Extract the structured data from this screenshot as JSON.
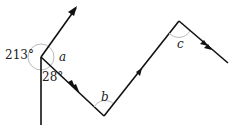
{
  "diagram": {
    "type": "angle-path",
    "angles": [
      {
        "id": "reflex",
        "label": "213°"
      },
      {
        "id": "a",
        "label": "a"
      },
      {
        "id": "bottom",
        "label": "28°"
      },
      {
        "id": "b",
        "label": "b"
      },
      {
        "id": "c",
        "label": "c"
      }
    ],
    "colors": {
      "line": "#111111",
      "arc": "#bbbbbb",
      "text": "#222222"
    }
  }
}
